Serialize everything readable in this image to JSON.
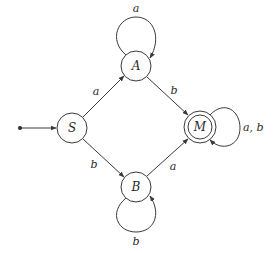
{
  "diagram": {
    "type": "finite-automaton",
    "states": [
      {
        "id": "S",
        "label": "S",
        "initial": true,
        "accepting": false
      },
      {
        "id": "A",
        "label": "A",
        "initial": false,
        "accepting": false
      },
      {
        "id": "B",
        "label": "B",
        "initial": false,
        "accepting": false
      },
      {
        "id": "M",
        "label": "M",
        "initial": false,
        "accepting": true
      }
    ],
    "transitions": [
      {
        "from": "S",
        "to": "A",
        "label": "a"
      },
      {
        "from": "S",
        "to": "B",
        "label": "b"
      },
      {
        "from": "A",
        "to": "A",
        "label": "a"
      },
      {
        "from": "A",
        "to": "M",
        "label": "b"
      },
      {
        "from": "B",
        "to": "B",
        "label": "b"
      },
      {
        "from": "B",
        "to": "M",
        "label": "a"
      },
      {
        "from": "M",
        "to": "M",
        "label": "a, b"
      }
    ]
  },
  "labels": {
    "S": "S",
    "A": "A",
    "B": "B",
    "M": "M",
    "S_to_A": "a",
    "S_to_B": "b",
    "A_loop": "a",
    "A_to_M": "b",
    "B_loop": "b",
    "B_to_M": "a",
    "M_loop": "a, b"
  },
  "colors": {
    "stroke": "#3a3a3a",
    "background": "#ffffff"
  }
}
